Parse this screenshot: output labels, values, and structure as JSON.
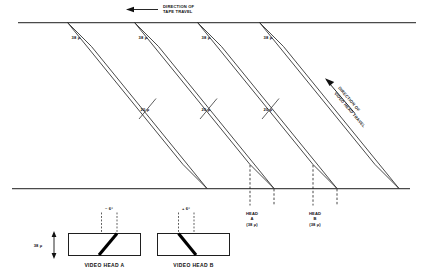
{
  "figure": {
    "tape_direction_label_line1": "DIRECTION OF",
    "tape_direction_label_line2": "TAPE TRAVEL",
    "head_direction_label_line1": "DIRECTION OF",
    "head_direction_label_line2": "VIDEO HEAD TRAVEL"
  },
  "tracks": [
    {
      "width_label": "38 µ"
    },
    {
      "width_label": "38 µ"
    },
    {
      "width_label": "38 µ"
    },
    {
      "width_label": "38 µ"
    }
  ],
  "guard_bands": [
    {
      "pitch_label": "20 µ"
    },
    {
      "pitch_label": "20 µ"
    },
    {
      "pitch_label": "20 µ"
    }
  ],
  "head_callouts": [
    {
      "name_line1": "HEAD",
      "name_line2": "A",
      "width_line": "(38 µ)"
    },
    {
      "name_line1": "HEAD",
      "name_line2": "B",
      "width_line": "(38 µ)"
    }
  ],
  "head_detail": {
    "height_label": "38 µ",
    "heads": [
      {
        "angle_label": "– 6°",
        "caption": "VIDEO HEAD A"
      },
      {
        "angle_label": "+ 6°",
        "caption": "VIDEO HEAD B"
      }
    ]
  },
  "colors": {
    "line": "#2a2a2a",
    "tape_edge": "#4a4a4a",
    "text": "#111111",
    "background": "#ffffff"
  }
}
